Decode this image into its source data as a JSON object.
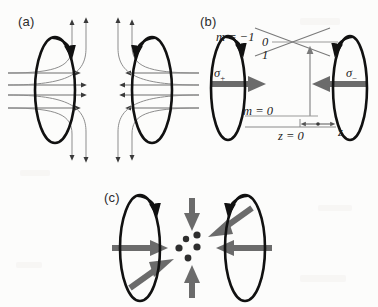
{
  "figure": {
    "background_color": "#fcfcfb",
    "width": 378,
    "height": 307,
    "colors": {
      "coil": "#111111",
      "field_line": "#6e6e6e",
      "beam_arrow": "#6b6b6b",
      "level_line": "#7a7a7a",
      "text": "#1c1c1c",
      "panel_label": "#2b2b2b"
    }
  },
  "panels": [
    {
      "id": "a",
      "label": "(a)",
      "label_x": 18,
      "label_y": 14,
      "description": "Anti-Helmholtz coil pair producing a quadrupole magnetic field",
      "coils": [
        {
          "name": "left-coil",
          "cx": 55,
          "cy": 90,
          "rx": 20,
          "ry": 53,
          "current_arrow": "clockwise-top"
        },
        {
          "name": "right-coil",
          "cx": 152,
          "cy": 90,
          "rx": 20,
          "ry": 53,
          "current_arrow": "counterclockwise-top"
        }
      ],
      "field_lines_horizontal": 8,
      "field_lines_vertical": 8
    },
    {
      "id": "b",
      "label": "(b)",
      "label_x": 200,
      "label_y": 14,
      "description": "Zeeman sublevels along z with sigma-plus and sigma-minus beams",
      "coils": [
        {
          "name": "left-coil",
          "cx": 228,
          "cy": 88,
          "rx": 17,
          "ry": 52,
          "current_arrow": "clockwise-top"
        },
        {
          "name": "right-coil",
          "cx": 350,
          "cy": 88,
          "rx": 17,
          "ry": 52,
          "current_arrow": "counterclockwise-top"
        }
      ],
      "level_labels": [
        {
          "name": "m-minus-one",
          "text": "m = −1",
          "x": 222,
          "y": 28
        },
        {
          "name": "m-zero-excited",
          "text": "0",
          "x": 265,
          "y": 41
        },
        {
          "name": "m-plus-one",
          "text": "1",
          "x": 265,
          "y": 54
        },
        {
          "name": "m-zero-ground",
          "text": "m = 0",
          "x": 245,
          "y": 104
        }
      ],
      "axis_labels": [
        {
          "name": "z-origin",
          "text": "z = 0",
          "x": 278,
          "y": 133
        },
        {
          "name": "z-axis",
          "text": "z",
          "x": 339,
          "y": 131
        }
      ],
      "beam_labels": [
        {
          "name": "sigma-plus",
          "text": "σ",
          "sub": "+",
          "x": 216,
          "y": 73
        },
        {
          "name": "sigma-minus",
          "text": "σ",
          "sub": "−",
          "x": 348,
          "y": 73
        }
      ],
      "transition_arrow": {
        "name": "laser-transition-arrow",
        "from_y": 116,
        "to_y": 52,
        "x": 310
      }
    },
    {
      "id": "c",
      "label": "(c)",
      "label_x": 104,
      "label_y": 190,
      "description": "Six counter-propagating laser beams converging on the trapped atom cloud",
      "coils": [
        {
          "name": "left-coil",
          "cx": 140,
          "cy": 248,
          "rx": 20,
          "ry": 53,
          "current_arrow": "clockwise-top"
        },
        {
          "name": "right-coil",
          "cx": 245,
          "cy": 248,
          "rx": 20,
          "ry": 53,
          "current_arrow": "counterclockwise-top"
        }
      ],
      "beams": [
        {
          "name": "beam-from-left",
          "direction": "right"
        },
        {
          "name": "beam-from-right",
          "direction": "left"
        },
        {
          "name": "beam-from-top",
          "direction": "down"
        },
        {
          "name": "beam-from-bottom",
          "direction": "up"
        },
        {
          "name": "beam-from-upper-right",
          "direction": "lower-left"
        },
        {
          "name": "beam-from-lower-left",
          "direction": "upper-right"
        }
      ],
      "atom_cloud": {
        "name": "atom-cloud",
        "count": 6,
        "dots": [
          {
            "cx": 186,
            "cy": 239,
            "r": 3.2
          },
          {
            "cx": 197,
            "cy": 235,
            "r": 3.6
          },
          {
            "cx": 179,
            "cy": 248,
            "r": 3.6
          },
          {
            "cx": 197,
            "cy": 247,
            "r": 3.6
          },
          {
            "cx": 188,
            "cy": 258,
            "r": 3.4
          }
        ]
      }
    }
  ]
}
